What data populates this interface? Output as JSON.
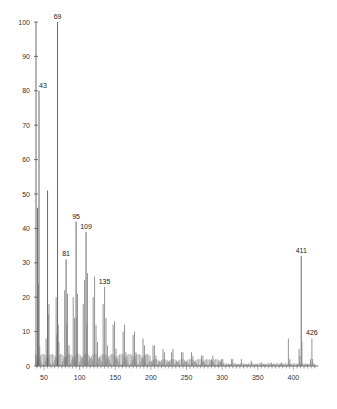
{
  "chart_data": {
    "type": "bar",
    "title": "",
    "xlabel": "",
    "ylabel": "",
    "xlim": [
      35,
      435
    ],
    "ylim": [
      0,
      100
    ],
    "grid": false,
    "x_ticks": [
      50,
      100,
      150,
      200,
      250,
      300,
      350,
      400
    ],
    "y_ticks": [
      0,
      10,
      20,
      30,
      40,
      50,
      60,
      70,
      80,
      90,
      100
    ],
    "labeled_peaks": [
      {
        "mz": 43,
        "intensity": 80,
        "label": "43"
      },
      {
        "mz": 69,
        "intensity": 100,
        "label": "69"
      },
      {
        "mz": 81,
        "intensity": 31,
        "label": "81"
      },
      {
        "mz": 95,
        "intensity": 42,
        "label": "95"
      },
      {
        "mz": 109,
        "intensity": 39,
        "label": "109"
      },
      {
        "mz": 135,
        "intensity": 23,
        "label": "135"
      },
      {
        "mz": 411,
        "intensity": 32,
        "label": "411"
      },
      {
        "mz": 426,
        "intensity": 8,
        "label": "426"
      }
    ],
    "peaks": {
      "mz": [
        41,
        42,
        43,
        44,
        53,
        55,
        56,
        57,
        67,
        68,
        69,
        70,
        71,
        79,
        81,
        82,
        83,
        85,
        91,
        93,
        95,
        96,
        97,
        105,
        107,
        109,
        110,
        111,
        119,
        121,
        123,
        125,
        133,
        135,
        137,
        139,
        147,
        149,
        151,
        161,
        163,
        165,
        175,
        177,
        179,
        189,
        191,
        193,
        203,
        205,
        207,
        217,
        219,
        229,
        231,
        243,
        245,
        257,
        259,
        271,
        273,
        285,
        287,
        299,
        301,
        313,
        315,
        327,
        341,
        355,
        369,
        383,
        393,
        395,
        408,
        409,
        411,
        412,
        424,
        426,
        427
      ],
      "intensity": [
        46,
        24,
        80,
        6,
        8,
        51,
        15,
        18,
        20,
        9,
        100,
        12,
        7,
        22,
        31,
        12,
        21,
        6,
        20,
        14,
        42,
        14,
        21,
        18,
        25,
        39,
        12,
        27,
        20,
        26,
        12,
        7,
        18,
        23,
        14,
        6,
        12,
        13,
        5,
        10,
        12,
        4,
        9,
        10,
        4,
        8,
        6,
        3,
        6,
        6,
        3,
        5,
        4,
        4,
        5,
        4,
        4,
        4,
        3,
        3,
        3,
        2,
        3,
        2,
        2,
        2,
        2,
        2,
        1.5,
        1,
        1,
        1,
        8,
        2,
        5,
        3,
        32,
        7,
        2,
        8,
        2
      ]
    }
  }
}
